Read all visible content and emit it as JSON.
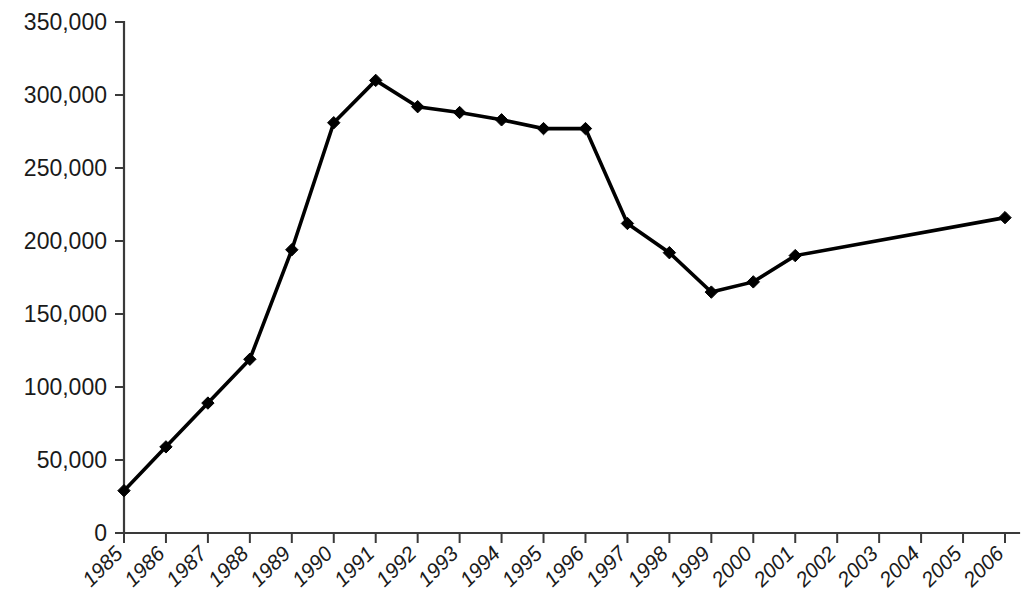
{
  "chart_data": {
    "type": "line",
    "title": "",
    "subtitle": "",
    "xlabel": "",
    "ylabel": "",
    "categories": [
      "1985",
      "1986",
      "1987",
      "1988",
      "1989",
      "1990",
      "1991",
      "1992",
      "1993",
      "1994",
      "1995",
      "1996",
      "1997",
      "1998",
      "1999",
      "2000",
      "2001",
      "2002",
      "2003",
      "2004",
      "2005",
      "2006"
    ],
    "series": [
      {
        "name": "series-1",
        "values": [
          29000,
          59000,
          89000,
          119000,
          194000,
          281000,
          310000,
          292000,
          288000,
          283000,
          277000,
          277000,
          212000,
          192000,
          165000,
          172000,
          190000,
          null,
          null,
          null,
          null,
          216000
        ]
      }
    ],
    "ylim": [
      0,
      350000
    ],
    "yticks": [
      0,
      50000,
      100000,
      150000,
      200000,
      250000,
      300000,
      350000
    ],
    "ytick_labels": [
      "0",
      "50,000",
      "100,000",
      "150,000",
      "200,000",
      "250,000",
      "300,000",
      "350,000"
    ],
    "xtick_labels": [
      "1985",
      "1986",
      "1987",
      "1988",
      "1989",
      "1990",
      "1991",
      "1992",
      "1993",
      "1994",
      "1995",
      "1996",
      "1997",
      "1998",
      "1999",
      "2000",
      "2001",
      "2002",
      "2003",
      "2004",
      "2005",
      "2006"
    ],
    "xtick_rotation_deg": -45,
    "grid": false,
    "legend": false,
    "legend_position": "none",
    "marker": "diamond",
    "line_color": "#000000",
    "marker_color": "#000000",
    "axis_color": "#3a3a3a",
    "background_color": "#ffffff",
    "note_unmarked_span": "2002-2005 have no plotted markers; line is straight from 2001 to 2006"
  },
  "layout": {
    "plot_left": 124,
    "plot_right": 1005,
    "plot_top": 22,
    "plot_bottom": 533,
    "width": 1021,
    "height": 613
  }
}
